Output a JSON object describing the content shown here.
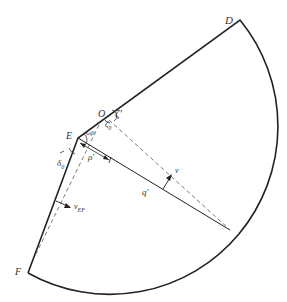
{
  "diagram": {
    "type": "geometric-sector",
    "points": {
      "D": {
        "label": "D",
        "x": 240,
        "y": 20
      },
      "O": {
        "label": "O",
        "x": 109,
        "y": 115
      },
      "E": {
        "label": "E",
        "x": 78,
        "y": 138
      },
      "F": {
        "label": "F",
        "x": 28,
        "y": 273
      }
    },
    "labels": {
      "D": "D",
      "O": "O",
      "E": "E",
      "F": "F",
      "zeta_prime": "ζ'",
      "zeta_0": "ζ",
      "zeta_0_sub": "0",
      "omega": "ωβ",
      "delta": "δ",
      "delta_sub": "0",
      "rho_prime": "ρ'",
      "q_prime": "q'",
      "v": "v",
      "v_ef": "v",
      "v_ef_sub": "EF"
    },
    "colors": {
      "stroke": "#222222",
      "dashed": "#555555",
      "text": "#333333"
    }
  }
}
